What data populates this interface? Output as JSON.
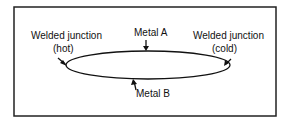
{
  "diagram": {
    "labels": {
      "hot_junction_line1": "Welded junction",
      "hot_junction_line2": "(hot)",
      "cold_junction_line1": "Welded junction",
      "cold_junction_line2": "(cold)",
      "metal_a": "Metal A",
      "metal_b": "Metal B"
    },
    "colors": {
      "stroke": "#111111",
      "background": "#ffffff"
    }
  }
}
